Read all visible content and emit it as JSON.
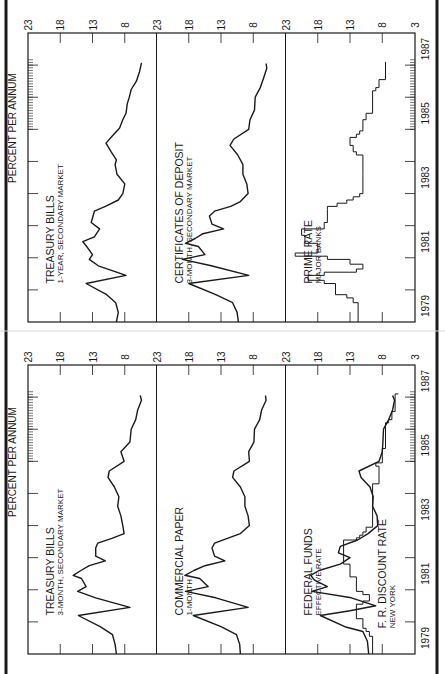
{
  "page": {
    "border_color": "#1a1a1a",
    "line_color": "#1a1a1a",
    "background": "#ffffff"
  },
  "axis": {
    "unit_label": "PERCENT PER ANNUM",
    "value_ticks": [
      23,
      18,
      13,
      8
    ],
    "last_panel_extra_tick": 3,
    "years": [
      "1979",
      "1981",
      "1983",
      "1985",
      "1987"
    ]
  },
  "chart_data": [
    {
      "type": "line",
      "title": "Interest rates, money and capital markets (left page)",
      "ylabel": "PERCENT PER ANNUM",
      "xlabel": "",
      "x_range": [
        1979,
        1987.2
      ],
      "grid": false,
      "panels": [
        {
          "name": "treasury-bills-3-month",
          "label": "TREASURY BILLS",
          "sublabel": "3-MONTH, SECONDARY MARKET",
          "ylim": [
            8,
            23
          ],
          "series": [
            {
              "name": "Treasury bills 3-month",
              "x": [
                1979.0,
                1979.3,
                1979.6,
                1979.85,
                1980.2,
                1980.45,
                1980.75,
                1980.95,
                1981.1,
                1981.35,
                1981.45,
                1981.6,
                1981.75,
                1981.9,
                1982.05,
                1982.3,
                1982.45,
                1982.6,
                1982.75,
                1983.0,
                1983.3,
                1983.6,
                1983.9,
                1984.2,
                1984.5,
                1984.7,
                1985.0,
                1985.3,
                1985.6,
                1986.0,
                1986.3,
                1986.6,
                1986.9,
                1987.05
              ],
              "y": [
                9.3,
                9.5,
                9.9,
                11.8,
                15.2,
                7.2,
                12.5,
                15.3,
                14.0,
                14.7,
                16.0,
                14.8,
                13.5,
                11.0,
                12.5,
                12.5,
                12.2,
                10.0,
                8.1,
                8.3,
                8.6,
                9.1,
                8.9,
                9.6,
                10.6,
                10.4,
                8.1,
                8.6,
                7.2,
                7.0,
                6.3,
                6.0,
                5.4,
                5.6
              ]
            }
          ]
        },
        {
          "name": "commercial-paper-1-month",
          "label": "COMMERCIAL PAPER",
          "sublabel": "1-MONTH",
          "ylim": [
            8,
            23
          ],
          "series": [
            {
              "name": "Commercial paper 1-month",
              "x": [
                1979.0,
                1979.3,
                1979.6,
                1979.85,
                1980.2,
                1980.45,
                1980.75,
                1980.95,
                1981.1,
                1981.35,
                1981.45,
                1981.6,
                1981.75,
                1981.9,
                1982.05,
                1982.3,
                1982.45,
                1982.6,
                1982.75,
                1983.0,
                1983.3,
                1983.6,
                1983.9,
                1984.2,
                1984.5,
                1984.7,
                1985.0,
                1985.3,
                1985.6,
                1986.0,
                1986.3,
                1986.6,
                1986.9,
                1987.05
              ],
              "y": [
                10.0,
                10.1,
                10.6,
                13.0,
                17.3,
                8.8,
                13.8,
                18.5,
                15.0,
                16.3,
                18.6,
                17.2,
                15.5,
                12.4,
                14.0,
                14.4,
                14.0,
                12.0,
                10.0,
                8.6,
                8.8,
                9.3,
                9.3,
                10.0,
                11.2,
                11.0,
                8.6,
                8.7,
                7.9,
                7.8,
                7.0,
                6.7,
                6.0,
                6.1
              ]
            }
          ]
        },
        {
          "name": "federal-funds",
          "label": "FEDERAL FUNDS",
          "sublabel": "EFFECTIVE RATE",
          "label2": "F. R. DISCOUNT RATE",
          "sublabel2": "NEW YORK",
          "ylim": [
            3,
            23
          ],
          "series": [
            {
              "name": "Federal funds effective rate",
              "x": [
                1979.0,
                1979.4,
                1979.7,
                1979.85,
                1980.2,
                1980.35,
                1980.5,
                1980.75,
                1980.95,
                1981.1,
                1981.3,
                1981.45,
                1981.6,
                1981.8,
                1982.0,
                1982.15,
                1982.35,
                1982.55,
                1982.75,
                1983.0,
                1983.3,
                1983.6,
                1983.9,
                1984.2,
                1984.5,
                1984.7,
                1985.0,
                1985.3,
                1985.6,
                1986.0,
                1986.3,
                1986.6,
                1986.9,
                1987.05
              ],
              "y": [
                10.1,
                10.3,
                11.0,
                13.8,
                17.6,
                13.0,
                9.0,
                12.8,
                18.9,
                16.5,
                18.5,
                19.1,
                17.8,
                14.5,
                13.0,
                14.8,
                14.5,
                11.8,
                10.2,
                8.7,
                8.8,
                9.5,
                9.4,
                9.9,
                11.3,
                11.6,
                8.5,
                8.0,
                7.9,
                7.8,
                7.0,
                6.4,
                6.1,
                6.4
              ]
            },
            {
              "name": "F.R. discount rate, New York",
              "step": true,
              "x": [
                1979.0,
                1979.55,
                1979.7,
                1979.8,
                1980.1,
                1980.4,
                1980.55,
                1980.65,
                1980.85,
                1980.95,
                1981.4,
                1981.8,
                1982.55,
                1982.62,
                1982.7,
                1982.8,
                1982.95,
                1984.3,
                1984.85,
                1984.95,
                1985.4,
                1986.2,
                1986.3,
                1986.55,
                1987.1
              ],
              "y": [
                9.5,
                10.0,
                10.5,
                11.0,
                12.0,
                12.0,
                11.0,
                10.0,
                11.0,
                12.0,
                13.0,
                14.0,
                12.0,
                11.5,
                11.0,
                10.5,
                9.5,
                8.5,
                9.0,
                8.0,
                7.5,
                7.0,
                6.5,
                6.0,
                5.5
              ]
            }
          ]
        }
      ]
    },
    {
      "type": "line",
      "title": "Interest rates, money and capital markets (right page)",
      "ylabel": "PERCENT PER ANNUM",
      "xlabel": "",
      "x_range": [
        1979,
        1987.2
      ],
      "grid": false,
      "panels": [
        {
          "name": "treasury-bills-1-year",
          "label": "TREASURY BILLS",
          "sublabel": "1-YEAR, SECONDARY MARKET",
          "ylim": [
            8,
            23
          ],
          "series": [
            {
              "name": "Treasury bills 1-year",
              "x": [
                1979.0,
                1979.3,
                1979.6,
                1979.85,
                1980.2,
                1980.45,
                1980.75,
                1980.95,
                1981.1,
                1981.35,
                1981.5,
                1981.65,
                1981.9,
                1982.1,
                1982.45,
                1982.6,
                1982.8,
                1983.0,
                1983.3,
                1983.6,
                1983.9,
                1984.05,
                1984.3,
                1984.57,
                1984.8,
                1985.04,
                1985.3,
                1985.5,
                1985.8,
                1986.0,
                1986.24,
                1986.5,
                1986.8,
                1987.07
              ],
              "y": [
                9.3,
                9.0,
                9.4,
                10.8,
                14.0,
                7.8,
                12.1,
                13.5,
                13.0,
                13.9,
                14.5,
                12.7,
                11.9,
                13.2,
                12.7,
                11.0,
                9.0,
                8.3,
                8.0,
                9.2,
                9.5,
                9.3,
                10.1,
                10.9,
                9.9,
                8.8,
                8.3,
                7.8,
                7.6,
                7.3,
                7.0,
                6.2,
                5.7,
                5.4
              ]
            }
          ]
        },
        {
          "name": "certificates-of-deposit-3-month",
          "label": "CERTIFICATES OF DEPOSIT",
          "sublabel": "3-MONTH, SECONDARY MARKET",
          "ylim": [
            8,
            23
          ],
          "series": [
            {
              "name": "Certificates of deposit 3-month",
              "x": [
                1979.0,
                1979.3,
                1979.6,
                1979.85,
                1980.2,
                1980.45,
                1980.75,
                1980.95,
                1981.1,
                1981.35,
                1981.45,
                1981.6,
                1981.75,
                1981.9,
                1982.05,
                1982.3,
                1982.45,
                1982.6,
                1982.75,
                1983.0,
                1983.3,
                1983.6,
                1983.9,
                1984.2,
                1984.5,
                1984.7,
                1985.0,
                1985.3,
                1985.6,
                1986.0,
                1986.3,
                1986.6,
                1986.9,
                1987.05
              ],
              "y": [
                10.3,
                10.5,
                11.2,
                13.8,
                18.0,
                8.7,
                14.5,
                19.0,
                15.5,
                16.5,
                18.5,
                17.0,
                15.8,
                12.6,
                14.4,
                14.8,
                14.0,
                11.5,
                10.0,
                8.8,
                9.0,
                9.6,
                9.6,
                10.4,
                11.6,
                11.0,
                8.7,
                8.5,
                7.8,
                7.7,
                6.9,
                6.4,
                5.9,
                6.0
              ]
            }
          ]
        },
        {
          "name": "prime-rate",
          "label": "PRIME RATE",
          "sublabel": "MAJOR BANKS",
          "ylim": [
            3,
            23
          ],
          "series": [
            {
              "name": "Prime rate, major banks",
              "step": true,
              "x": [
                1979.0,
                1979.6,
                1979.75,
                1979.85,
                1980.0,
                1980.2,
                1980.3,
                1980.45,
                1980.55,
                1980.65,
                1980.8,
                1980.95,
                1981.05,
                1981.15,
                1981.3,
                1981.45,
                1981.7,
                1981.9,
                1982.1,
                1982.5,
                1982.6,
                1982.7,
                1982.8,
                1982.9,
                1983.0,
                1983.6,
                1984.2,
                1984.3,
                1984.5,
                1984.75,
                1984.85,
                1984.95,
                1985.3,
                1985.5,
                1986.2,
                1986.3,
                1986.55,
                1987.1
              ],
              "y": [
                11.75,
                12.5,
                13.5,
                15.25,
                15.25,
                17.0,
                19.5,
                17.0,
                12.0,
                11.0,
                13.0,
                16.5,
                21.5,
                18.0,
                18.0,
                20.0,
                20.5,
                17.0,
                16.5,
                16.5,
                15.0,
                13.5,
                12.5,
                11.5,
                11.0,
                11.0,
                12.0,
                12.5,
                13.0,
                12.0,
                11.5,
                11.0,
                10.5,
                9.5,
                9.0,
                8.5,
                7.5,
                7.5
              ]
            }
          ]
        }
      ]
    }
  ]
}
